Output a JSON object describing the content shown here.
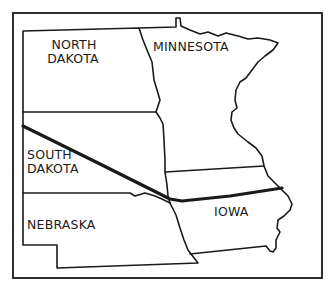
{
  "map": {
    "states": [
      {
        "id": "north-dakota",
        "line1": "NORTH",
        "line2": "DAKOTA"
      },
      {
        "id": "minnesota",
        "line1": "MINNESOTA",
        "line2": ""
      },
      {
        "id": "south-dakota",
        "line1": "SOUTH",
        "line2": "DAKOTA"
      },
      {
        "id": "nebraska",
        "line1": "NEBRASKA",
        "line2": ""
      },
      {
        "id": "iowa",
        "line1": "IOWA",
        "line2": ""
      }
    ],
    "colors": {
      "ink": "#1a1a1a",
      "background": "#ffffff"
    }
  }
}
